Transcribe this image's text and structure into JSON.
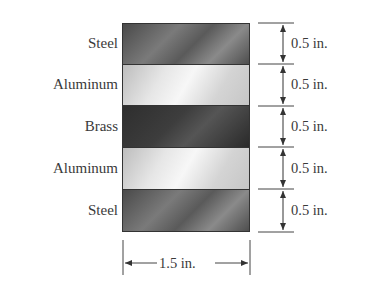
{
  "diagram": {
    "layers": [
      {
        "material": "Steel",
        "thickness": "0.5 in."
      },
      {
        "material": "Aluminum",
        "thickness": "0.5 in."
      },
      {
        "material": "Brass",
        "thickness": "0.5 in."
      },
      {
        "material": "Aluminum",
        "thickness": "0.5 in."
      },
      {
        "material": "Steel",
        "thickness": "0.5 in."
      }
    ],
    "width_label": "1.5 in."
  }
}
